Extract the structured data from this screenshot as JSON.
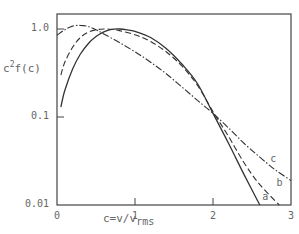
{
  "chart_data": {
    "type": "line",
    "title": "",
    "xlabel": "c=v/v_rms",
    "xlabel_main": "c=v/v",
    "xlabel_sub": "rms",
    "ylabel": "c^2 f(c)",
    "ylabel_base": "c",
    "ylabel_sup": "2",
    "ylabel_rest": "f(c)",
    "yscale": "log",
    "xlim": [
      0,
      3
    ],
    "ylim": [
      0.01,
      1.4
    ],
    "xticks": [
      "0",
      "1",
      "2",
      "3"
    ],
    "yticks": [
      "0.01",
      "0.1",
      "1.0"
    ],
    "grid": false,
    "legend": "inline curve labels",
    "series": [
      {
        "name": "a",
        "style": "solid",
        "x": [
          0.05,
          0.1,
          0.2,
          0.3,
          0.4,
          0.5,
          0.6,
          0.7,
          0.8,
          0.9,
          1.0,
          1.2,
          1.4,
          1.6,
          1.8,
          2.0,
          2.2,
          2.4,
          2.6
        ],
        "y": [
          0.13,
          0.2,
          0.35,
          0.52,
          0.68,
          0.82,
          0.93,
          0.99,
          1.0,
          0.98,
          0.94,
          0.8,
          0.6,
          0.4,
          0.24,
          0.11,
          0.05,
          0.022,
          0.01
        ]
      },
      {
        "name": "b",
        "style": "dashed",
        "x": [
          0.05,
          0.1,
          0.2,
          0.3,
          0.4,
          0.5,
          0.6,
          0.7,
          0.8,
          1.0,
          1.2,
          1.4,
          1.6,
          1.8,
          2.0,
          2.2,
          2.4,
          2.6,
          2.85
        ],
        "y": [
          0.3,
          0.42,
          0.62,
          0.8,
          0.92,
          0.98,
          1.0,
          0.99,
          0.96,
          0.86,
          0.72,
          0.55,
          0.38,
          0.23,
          0.115,
          0.06,
          0.03,
          0.017,
          0.01
        ]
      },
      {
        "name": "c",
        "style": "dash-dot",
        "x": [
          0.0,
          0.1,
          0.2,
          0.3,
          0.4,
          0.5,
          0.6,
          0.8,
          1.0,
          1.2,
          1.4,
          1.6,
          1.8,
          2.0,
          2.2,
          2.4,
          2.6,
          2.8,
          3.0
        ],
        "y": [
          0.85,
          0.98,
          1.08,
          1.1,
          1.07,
          0.98,
          0.88,
          0.7,
          0.55,
          0.42,
          0.31,
          0.22,
          0.155,
          0.11,
          0.075,
          0.05,
          0.035,
          0.025,
          0.019
        ]
      }
    ],
    "annotations": [
      {
        "text": "a",
        "x": 2.62,
        "y": 0.011
      },
      {
        "text": "b",
        "x": 2.8,
        "y": 0.016
      },
      {
        "text": "c",
        "x": 2.72,
        "y": 0.03
      }
    ]
  }
}
